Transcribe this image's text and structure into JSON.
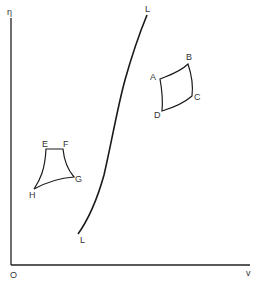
{
  "axes": {
    "y_label": "η",
    "x_label": "v",
    "origin_label": "O"
  },
  "curve": {
    "top_label": "L",
    "bottom_label": "L"
  },
  "cycle_1": {
    "labels": [
      "A",
      "B",
      "C",
      "D"
    ]
  },
  "cycle_2": {
    "labels": [
      "E",
      "F",
      "G",
      "H"
    ]
  },
  "colors": {
    "line": "#1a1a1a",
    "text": "#333333",
    "background": "#ffffff"
  }
}
